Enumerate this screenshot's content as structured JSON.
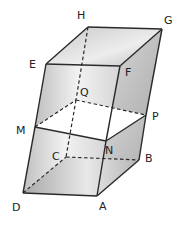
{
  "figure": {
    "type": "parallelepiped-section",
    "vertices": {
      "A": {
        "label": "A",
        "x": 97,
        "y": 196,
        "lx": 99,
        "ly": 210
      },
      "B": {
        "label": "B",
        "x": 139,
        "y": 160,
        "lx": 145,
        "ly": 162
      },
      "C": {
        "label": "C",
        "x": 66,
        "y": 157,
        "lx": 52,
        "ly": 160
      },
      "D": {
        "label": "D",
        "x": 23,
        "y": 193,
        "lx": 12,
        "ly": 211
      },
      "E": {
        "label": "E",
        "x": 46,
        "y": 64,
        "lx": 29,
        "ly": 68
      },
      "F": {
        "label": "F",
        "x": 120,
        "y": 66,
        "lx": 125,
        "ly": 76
      },
      "G": {
        "label": "G",
        "x": 162,
        "y": 29,
        "lx": 164,
        "ly": 24
      },
      "H": {
        "label": "H",
        "x": 88,
        "y": 27,
        "lx": 77,
        "ly": 19
      },
      "M": {
        "label": "M",
        "x": 35,
        "y": 127,
        "lx": 16,
        "ly": 134
      },
      "N": {
        "label": "N",
        "x": 106,
        "y": 141,
        "lx": 105,
        "ly": 154
      },
      "P": {
        "label": "P",
        "x": 146,
        "y": 115,
        "lx": 152,
        "ly": 120
      },
      "Q": {
        "label": "Q",
        "x": 76,
        "y": 100,
        "lx": 80,
        "ly": 96
      }
    },
    "solid_edges": [
      "EF",
      "FG",
      "GH",
      "HE",
      "EM",
      "MD",
      "DA",
      "AN",
      "NF",
      "AB",
      "BP",
      "PG",
      "MN",
      "NP"
    ],
    "hidden_edges": [
      "HQ",
      "QC",
      "DC",
      "CB",
      "MQ",
      "QP"
    ],
    "shading": {
      "light": "#e6e6e6",
      "mid": "#c9c9c9",
      "dark": "#b3b3b3",
      "section": "#ffffff"
    }
  }
}
